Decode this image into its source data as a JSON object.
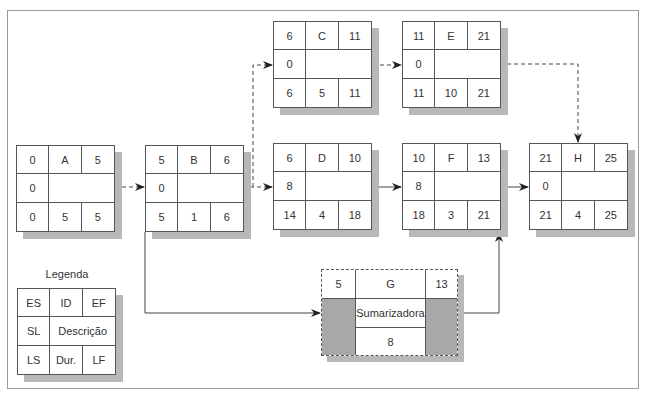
{
  "diagram": {
    "type": "precedence network (activity-on-node)",
    "nodes": [
      {
        "id": "A",
        "es": "0",
        "ef": "5",
        "sl": "0",
        "desc": "",
        "ls": "0",
        "dur": "5",
        "lf": "5"
      },
      {
        "id": "B",
        "es": "5",
        "ef": "6",
        "sl": "0",
        "desc": "",
        "ls": "5",
        "dur": "1",
        "lf": "6"
      },
      {
        "id": "C",
        "es": "6",
        "ef": "11",
        "sl": "0",
        "desc": "",
        "ls": "6",
        "dur": "5",
        "lf": "11"
      },
      {
        "id": "D",
        "es": "6",
        "ef": "10",
        "sl": "8",
        "desc": "",
        "ls": "14",
        "dur": "4",
        "lf": "18"
      },
      {
        "id": "E",
        "es": "11",
        "ef": "21",
        "sl": "0",
        "desc": "",
        "ls": "11",
        "dur": "10",
        "lf": "21"
      },
      {
        "id": "F",
        "es": "10",
        "ef": "13",
        "sl": "8",
        "desc": "",
        "ls": "18",
        "dur": "3",
        "lf": "21"
      },
      {
        "id": "H",
        "es": "21",
        "ef": "25",
        "sl": "0",
        "desc": "",
        "ls": "21",
        "dur": "4",
        "lf": "25"
      }
    ],
    "summary": {
      "id": "G",
      "es": "5",
      "ef": "13",
      "desc": "Sumarizadora",
      "dur": "8"
    },
    "edges": [
      {
        "from": "A",
        "to": "B",
        "style": "dashed"
      },
      {
        "from": "B",
        "to": "C",
        "style": "dashed"
      },
      {
        "from": "B",
        "to": "D",
        "style": "dashed"
      },
      {
        "from": "C",
        "to": "E",
        "style": "dashed"
      },
      {
        "from": "E",
        "to": "H",
        "style": "dashed"
      },
      {
        "from": "D",
        "to": "F",
        "style": "solid"
      },
      {
        "from": "F",
        "to": "H",
        "style": "solid"
      },
      {
        "from": "B",
        "to": "G",
        "style": "solid"
      },
      {
        "from": "G",
        "to": "F",
        "style": "solid"
      }
    ],
    "legend": {
      "title": "Legenda",
      "es": "ES",
      "id": "ID",
      "ef": "EF",
      "sl": "SL",
      "desc": "Descrição",
      "ls": "LS",
      "dur": "Dur.",
      "lf": "LF"
    }
  }
}
